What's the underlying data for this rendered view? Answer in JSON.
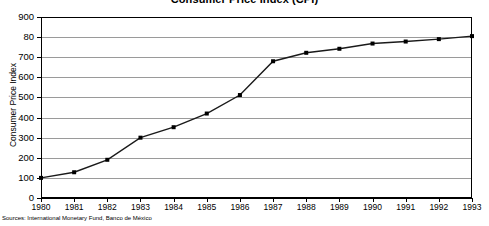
{
  "chart_data": {
    "type": "line",
    "title": "Consumer Price Index (CPI)",
    "xlabel": "",
    "ylabel": "Consumer Price Index",
    "categories": [
      "1980",
      "1981",
      "1982",
      "1983",
      "1984",
      "1985",
      "1986",
      "1987",
      "1988",
      "1989",
      "1990",
      "1991",
      "1992",
      "1993"
    ],
    "x": [
      1980,
      1981,
      1982,
      1983,
      1984,
      1985,
      1986,
      1987,
      1988,
      1989,
      1990,
      1991,
      1992,
      1993
    ],
    "values": [
      100,
      128,
      190,
      300,
      352,
      420,
      512,
      680,
      722,
      742,
      768,
      778,
      790,
      805
    ],
    "series": [
      {
        "name": "Consumer Price Index",
        "values": [
          100,
          128,
          190,
          300,
          352,
          420,
          512,
          680,
          722,
          742,
          768,
          778,
          790,
          805
        ]
      }
    ],
    "ylim": [
      0,
      900
    ],
    "xlim": [
      1980,
      1993
    ],
    "yticks": [
      0,
      100,
      200,
      300,
      400,
      500,
      600,
      700,
      800,
      900
    ],
    "ytick_labels": [
      "0",
      "100",
      "200",
      "300",
      "400",
      "500",
      "600",
      "700",
      "80",
      "900"
    ],
    "xtick_labels": [
      "1980",
      "1981",
      "1982",
      "1983",
      "1984",
      "1985",
      "1986",
      "1987",
      "1988",
      "1989",
      "1990",
      "1991",
      "1992",
      "1993"
    ],
    "grid": true,
    "grid_axis": "y",
    "legend": false,
    "marker": "square",
    "line_color": "#1a1a1a",
    "grid_color": "#9a9a9a",
    "axis_color": "#000000"
  },
  "footer": {
    "source_note": "Sources: International Monetary Fund, Banco de México"
  }
}
